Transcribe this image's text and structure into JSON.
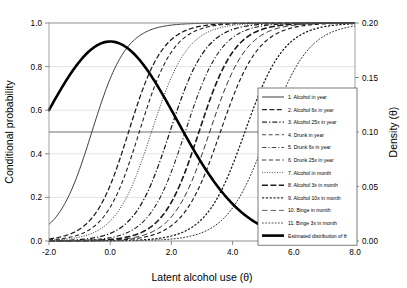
{
  "chart_data": {
    "type": "line",
    "title": "",
    "xlabel": "Latent alcohol use (θ)",
    "ylabel": "Conditional probability",
    "ylabel_right": "Density (θ)",
    "xlim": [
      -2.0,
      8.0
    ],
    "ylim": [
      0.0,
      1.0
    ],
    "ylim_right": [
      0.0,
      0.2
    ],
    "xticks": [
      "-2.0",
      "0.0",
      "2.0",
      "4.0",
      "6.0",
      "8.0"
    ],
    "xtick_values": [
      -2.0,
      0.0,
      2.0,
      4.0,
      6.0,
      8.0
    ],
    "yticks": [
      "0.0",
      "0.2",
      "0.4",
      "0.6",
      "0.8",
      "1.0"
    ],
    "ytick_values": [
      0.0,
      0.2,
      0.4,
      0.6,
      0.8,
      1.0
    ],
    "yticks_right": [
      "0.00",
      "0.05",
      "0.10",
      "0.15",
      "0.20"
    ],
    "ytick_values_right": [
      0.0,
      0.05,
      0.1,
      0.15,
      0.2
    ],
    "grid": true,
    "reference_line_y": 0.5,
    "legend_position": "right-inside",
    "series": [
      {
        "name": "1. Alcohol in year",
        "dash": "none",
        "width": 0.85,
        "color": "#1a1a1a",
        "location": -0.6,
        "slope": 1.05
      },
      {
        "name": "2. Alcohol 6x in year",
        "dash": "5,2.4",
        "width": 1.25,
        "color": "#272727",
        "location": 0.6,
        "slope": 1.05
      },
      {
        "name": "3. Alcohol 25x in year",
        "dash": "5,2,1.3,2",
        "width": 1.25,
        "color": "#272727",
        "location": 1.95,
        "slope": 1.0
      },
      {
        "name": "4. Drunk in year",
        "dash": "4,2.6",
        "width": 1.05,
        "color": "#4a4a4a",
        "location": 0.95,
        "slope": 1.05
      },
      {
        "name": "5. Drunk 6x in year",
        "dash": "4.5,2,1.2,2",
        "width": 1.05,
        "color": "#4a4a4a",
        "location": 2.45,
        "slope": 1.0
      },
      {
        "name": "6. Drunk 25x in year",
        "dash": "4.2,2.6",
        "width": 1.15,
        "color": "#3a3a3a",
        "location": 3.6,
        "slope": 0.95
      },
      {
        "name": "7. Alcohol in month",
        "dash": "1,1.5",
        "width": 0.9,
        "color": "#4a4a4a",
        "location": 1.35,
        "slope": 1.0
      },
      {
        "name": "8. Alcohol 3x in month",
        "dash": "6,2.4",
        "width": 1.6,
        "color": "#1f1f1f",
        "location": 2.9,
        "slope": 1.0
      },
      {
        "name": "9. Alcohol 10x in month",
        "dash": "2.2,1.6",
        "width": 1.25,
        "color": "#2e2e2e",
        "location": 4.4,
        "slope": 0.92
      },
      {
        "name": "10. Binge in month",
        "dash": "5.5,3",
        "width": 0.9,
        "color": "#565656",
        "location": 3.25,
        "slope": 0.98
      },
      {
        "name": "11. Binge 3x in month",
        "dash": "1.8,1.4",
        "width": 0.95,
        "color": "#4a4a4a",
        "location": 5.15,
        "slope": 0.88
      }
    ],
    "density_series": {
      "name": "Estimated distribution of θ",
      "dash": "none",
      "width": 2.6,
      "color": "#000000",
      "mean": 0.0,
      "sd": 2.18,
      "peak_density": 0.183,
      "x_start": -2.0,
      "x_end": 8.0
    }
  },
  "legend": {
    "entries": [
      "1. Alcohol in year",
      "2. Alcohol 6x in year",
      "3. Alcohol 25x in year",
      "4. Drunk in year",
      "5. Drunk 6x in year",
      "6. Drunk 25x in year",
      "7. Alcohol in month",
      "8. Alcohol 3x in month",
      "9. Alcohol 10x in month",
      "10. Binge in month",
      "11. Binge 3x in month",
      "Estimated distribution of θ"
    ]
  }
}
